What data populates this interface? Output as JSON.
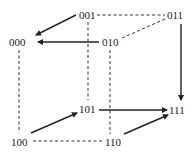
{
  "diagram": {
    "nodes": [
      {
        "id": "n001",
        "label": "001",
        "x": 79,
        "y": 10
      },
      {
        "id": "n011",
        "label": "011",
        "x": 167,
        "y": 10
      },
      {
        "id": "n000",
        "label": "000",
        "x": 9,
        "y": 37
      },
      {
        "id": "n010",
        "label": "010",
        "x": 102,
        "y": 37
      },
      {
        "id": "n101",
        "label": "101",
        "x": 79,
        "y": 104
      },
      {
        "id": "n111",
        "label": "111",
        "x": 169,
        "y": 105
      },
      {
        "id": "n100",
        "label": "100",
        "x": 11,
        "y": 137
      },
      {
        "id": "n110",
        "label": "110",
        "x": 105,
        "y": 137
      }
    ],
    "dashed_edges": [
      [
        "001",
        "011"
      ],
      [
        "011",
        "010"
      ],
      [
        "001",
        "101"
      ],
      [
        "010",
        "110"
      ],
      [
        "000",
        "100"
      ],
      [
        "100",
        "110"
      ]
    ],
    "arrows": [
      {
        "from": "001",
        "to": "000"
      },
      {
        "from": "010",
        "to": "000"
      },
      {
        "from": "011",
        "to": "111"
      },
      {
        "from": "101",
        "to": "111"
      },
      {
        "from": "100",
        "to": "101"
      },
      {
        "from": "110",
        "to": "111"
      }
    ],
    "colors": {
      "line": "#222222",
      "background": "#ffffff"
    }
  }
}
